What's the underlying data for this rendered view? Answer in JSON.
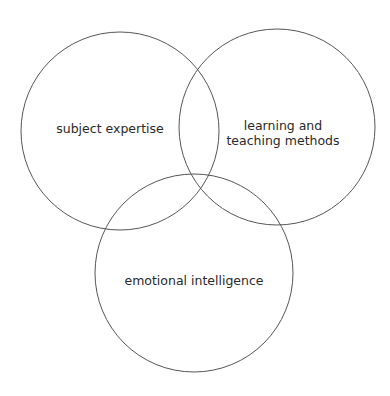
{
  "diagram": {
    "type": "venn",
    "stroke_color": "#555555",
    "circles": [
      {
        "id": "subject",
        "label": "subject expertise",
        "cx": 120,
        "cy": 131,
        "r": 99
      },
      {
        "id": "methods",
        "label_line1": "learning and",
        "label_line2": "teaching methods",
        "cx": 277,
        "cy": 127,
        "r": 98
      },
      {
        "id": "emotional",
        "label": "emotional intelligence",
        "cx": 194,
        "cy": 273,
        "r": 99
      }
    ]
  }
}
